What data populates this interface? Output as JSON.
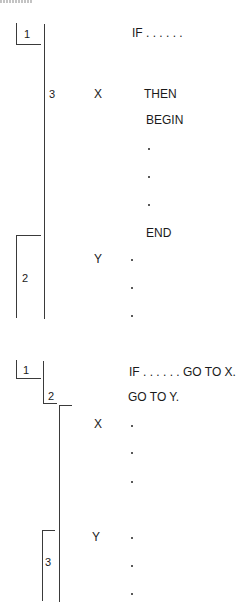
{
  "diagram1": {
    "boxes": [
      "1",
      "3",
      "2"
    ],
    "labels": {
      "x": "X",
      "y": "Y"
    },
    "code": {
      "if": "IF . . . . . .",
      "then": "THEN",
      "begin": "BEGIN",
      "end": "END"
    }
  },
  "diagram2": {
    "boxes": [
      "1",
      "2",
      "3"
    ],
    "labels": {
      "x": "X",
      "y": "Y"
    },
    "code": {
      "if_goto": "IF . . . . . . GO TO X.",
      "goto_y": "GO TO Y."
    }
  },
  "colors": {
    "line": "#3a3a3a",
    "text": "#1a1a1a",
    "background": "#ffffff"
  }
}
